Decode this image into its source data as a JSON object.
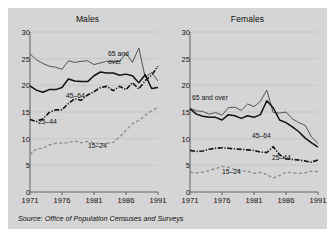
{
  "source_note": "Source: Office of Population Censuses and Surveys",
  "colors": {
    "background": "#d5d5d5",
    "border": "#ffffff",
    "axis": "#555555",
    "grid": "#bdbdbd",
    "line_65_over": "#444444",
    "line_45_64": "#111111",
    "line_25_44": "#111111",
    "line_15_24": "#8a8a8a",
    "text": "#111111"
  },
  "panels": [
    {
      "id": "males",
      "title": "Males",
      "labels": [
        {
          "text": "65 and\nover",
          "x": 78,
          "y": 18
        },
        {
          "text": "45–64",
          "x": 36,
          "y": 60
        },
        {
          "text": "25–44",
          "x": 8,
          "y": 86
        },
        {
          "text": "15–24",
          "x": 58,
          "y": 110
        }
      ]
    },
    {
      "id": "females",
      "title": "Females",
      "labels": [
        {
          "text": "65 and over",
          "x": 2,
          "y": 62
        },
        {
          "text": "45–64",
          "x": 62,
          "y": 100
        },
        {
          "text": "25–44",
          "x": 82,
          "y": 122
        },
        {
          "text": "15–24",
          "x": 32,
          "y": 136
        }
      ]
    }
  ],
  "chart_data": {
    "type": "line",
    "title": "",
    "subtitle": "",
    "xlabel": "",
    "ylabel": "",
    "xlim": [
      1971,
      1991
    ],
    "ylim": [
      0,
      30
    ],
    "xticks": [
      1971,
      1976,
      1981,
      1986,
      1991
    ],
    "yticks": [
      0,
      5,
      10,
      15,
      20,
      25,
      30
    ],
    "grid": true,
    "legend_position": "inline-annotations",
    "x": [
      1971,
      1972,
      1973,
      1974,
      1975,
      1976,
      1977,
      1978,
      1979,
      1980,
      1981,
      1982,
      1983,
      1984,
      1985,
      1986,
      1987,
      1988,
      1989,
      1990,
      1991
    ],
    "panels": [
      {
        "name": "Males",
        "series": [
          {
            "name": "65 and over",
            "style": "solid-thin",
            "values": [
              25.9,
              24.8,
              24.1,
              23.6,
              23.4,
              23.0,
              24.6,
              24.3,
              24.5,
              24.6,
              23.9,
              24.2,
              24.5,
              24.4,
              24.5,
              26.0,
              24.3,
              27.0,
              21.5,
              22.4,
              20.8
            ]
          },
          {
            "name": "45–64",
            "style": "solid-thick",
            "values": [
              19.9,
              19.1,
              18.7,
              19.2,
              19.2,
              19.6,
              21.2,
              20.8,
              20.7,
              20.7,
              21.8,
              22.5,
              22.3,
              22.3,
              21.9,
              22.1,
              21.8,
              20.5,
              22.0,
              19.4,
              19.6
            ]
          },
          {
            "name": "25–44",
            "style": "dashdot",
            "values": [
              13.6,
              13.2,
              13.7,
              14.9,
              15.4,
              15.4,
              16.6,
              17.5,
              17.2,
              18.2,
              18.8,
              19.6,
              19.8,
              19.0,
              19.8,
              19.2,
              20.5,
              19.3,
              20.9,
              21.9,
              23.6
            ]
          },
          {
            "name": "15–24",
            "style": "dashed",
            "values": [
              7.0,
              8.1,
              8.2,
              8.8,
              9.1,
              9.2,
              9.2,
              9.6,
              9.2,
              9.5,
              9.2,
              9.0,
              9.1,
              9.3,
              10.3,
              11.6,
              12.8,
              13.4,
              14.4,
              15.2,
              15.9
            ]
          }
        ]
      },
      {
        "name": "Females",
        "series": [
          {
            "name": "65 and over",
            "style": "solid-thin",
            "values": [
              15.7,
              15.2,
              15.1,
              14.6,
              14.9,
              14.4,
              15.8,
              15.9,
              15.3,
              16.5,
              16.0,
              17.0,
              19.1,
              14.9,
              14.8,
              15.0,
              13.7,
              13.0,
              12.5,
              10.3,
              9.1
            ]
          },
          {
            "name": "45–64",
            "style": "solid-thick",
            "values": [
              15.6,
              14.6,
              14.2,
              14.0,
              14.0,
              13.5,
              14.5,
              14.3,
              13.8,
              14.3,
              14.0,
              14.5,
              17.1,
              15.8,
              13.5,
              13.0,
              12.2,
              11.3,
              10.1,
              9.2,
              8.4
            ]
          },
          {
            "name": "25–44",
            "style": "dashdot",
            "values": [
              7.8,
              7.6,
              7.7,
              8.0,
              8.2,
              8.3,
              8.2,
              8.1,
              8.0,
              7.9,
              7.8,
              7.5,
              7.4,
              8.5,
              7.0,
              6.2,
              6.1,
              6.0,
              5.8,
              5.6,
              6.0
            ]
          },
          {
            "name": "15–24",
            "style": "dashed",
            "values": [
              3.7,
              3.6,
              3.7,
              4.0,
              4.4,
              4.8,
              4.6,
              4.2,
              4.0,
              3.9,
              3.5,
              3.7,
              3.3,
              2.6,
              3.1,
              3.7,
              3.6,
              3.5,
              3.6,
              3.9,
              3.8
            ]
          }
        ]
      }
    ]
  }
}
